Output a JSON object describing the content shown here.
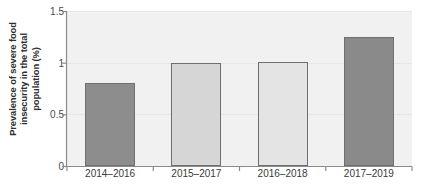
{
  "chart_data": {
    "type": "bar",
    "title": "",
    "subtitle": "",
    "xlabel": "",
    "ylabel": "Prevalence of severe food insecurity in the total population (%)",
    "ylabel_lines": [
      "Prevalence of severe food",
      "insecurity in the total",
      "population (%)"
    ],
    "categories": [
      "2014–2016",
      "2015–2017",
      "2016–2018",
      "2017–2019"
    ],
    "values": [
      0.8,
      1.0,
      1.01,
      1.25
    ],
    "ylim": [
      0,
      1.5
    ],
    "yticks": [
      0,
      0.5,
      1,
      1.5
    ],
    "ytick_labels": [
      "0",
      "0.5",
      "1",
      "1.5"
    ],
    "grid": true,
    "legend": "none",
    "bar_colors": [
      "#8d8d8d",
      "#d6d6d6",
      "#e4e4e4",
      "#8a8a8a"
    ],
    "bar_edge_color": "#6f6f6f",
    "plot_background": "#f1f1f1",
    "axis_color": "#8a8a8a"
  }
}
